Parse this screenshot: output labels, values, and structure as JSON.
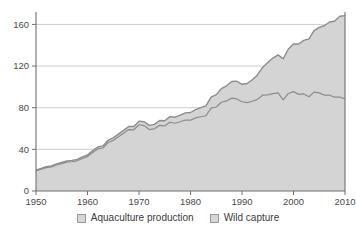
{
  "legend": {
    "position": "bottom-center",
    "items": [
      {
        "label": "Aquaculture production",
        "color": "#d6d6d6",
        "swatch": "square-swatch"
      },
      {
        "label": "Wild capture",
        "color": "#d6d6d6",
        "swatch": "square-swatch"
      }
    ]
  },
  "axes": {
    "y_ticks": [
      "0",
      "40",
      "80",
      "120",
      "160"
    ],
    "x_ticks": [
      "1950",
      "1960",
      "1970",
      "1980",
      "1990",
      "2000",
      "2010"
    ]
  },
  "colors": {
    "fill": "#d4d4d4",
    "line": "#8c8c8c",
    "grid": "#bfbfbf",
    "axis": "#6f6f6f",
    "text": "#3a3a3a",
    "background": "#ffffff"
  },
  "chart_data": {
    "type": "area",
    "stacked": true,
    "title": "",
    "subtitle": "",
    "xlabel": "",
    "ylabel": "",
    "xlim": [
      1950,
      2010
    ],
    "ylim": [
      0,
      170
    ],
    "grid": true,
    "legend_position": "bottom-center",
    "x": [
      1950,
      1951,
      1952,
      1953,
      1954,
      1955,
      1956,
      1957,
      1958,
      1959,
      1960,
      1961,
      1962,
      1963,
      1964,
      1965,
      1966,
      1967,
      1968,
      1969,
      1970,
      1971,
      1972,
      1973,
      1974,
      1975,
      1976,
      1977,
      1978,
      1979,
      1980,
      1981,
      1982,
      1983,
      1984,
      1985,
      1986,
      1987,
      1988,
      1989,
      1990,
      1991,
      1992,
      1993,
      1994,
      1995,
      1996,
      1997,
      1998,
      1999,
      2000,
      2001,
      2002,
      2003,
      2004,
      2005,
      2006,
      2007,
      2008,
      2009,
      2010
    ],
    "series": [
      {
        "name": "Wild capture",
        "values": [
          19.3,
          21.0,
          22.5,
          23.2,
          25.0,
          26.3,
          27.7,
          28.1,
          29.0,
          31.2,
          33.0,
          37.0,
          40.4,
          41.3,
          46.6,
          48.6,
          52.0,
          55.4,
          59.0,
          58.8,
          63.6,
          62.8,
          59.0,
          59.7,
          63.1,
          62.5,
          66.0,
          65.1,
          66.5,
          68.2,
          68.0,
          70.2,
          71.3,
          72.3,
          79.6,
          80.7,
          85.2,
          86.5,
          89.2,
          88.4,
          85.7,
          84.9,
          86.2,
          88.0,
          92.0,
          92.3,
          93.6,
          94.2,
          87.6,
          93.7,
          95.5,
          92.8,
          93.2,
          90.5,
          95.0,
          94.2,
          92.0,
          92.0,
          90.1,
          90.1,
          88.6
        ]
      },
      {
        "name": "Aquaculture production",
        "values": [
          0.6,
          0.7,
          0.8,
          0.9,
          1.0,
          1.1,
          1.2,
          1.3,
          1.4,
          1.5,
          1.6,
          1.8,
          1.9,
          2.0,
          2.2,
          2.4,
          2.6,
          2.8,
          3.0,
          3.2,
          3.5,
          3.7,
          4.0,
          4.3,
          4.6,
          5.0,
          5.4,
          5.8,
          6.3,
          6.8,
          7.4,
          8.0,
          8.7,
          9.5,
          10.6,
          11.8,
          13.1,
          14.5,
          16.0,
          17.0,
          16.8,
          18.3,
          20.6,
          23.5,
          26.7,
          31.2,
          34.1,
          36.5,
          39.4,
          42.7,
          45.7,
          48.4,
          51.4,
          55.6,
          59.0,
          63.0,
          66.7,
          70.3,
          73.2,
          77.7,
          79.8
        ]
      }
    ],
    "totals": [
      19.9,
      21.7,
      23.3,
      24.1,
      26.0,
      27.4,
      28.9,
      29.4,
      30.4,
      32.7,
      34.6,
      38.8,
      42.3,
      43.3,
      48.8,
      51.0,
      54.6,
      58.2,
      62.0,
      62.0,
      67.1,
      66.5,
      63.0,
      64.0,
      67.7,
      67.5,
      71.4,
      70.9,
      72.8,
      75.0,
      75.4,
      78.2,
      80.0,
      81.8,
      90.2,
      92.5,
      98.3,
      101.0,
      105.2,
      105.4,
      102.5,
      103.2,
      106.8,
      111.5,
      118.7,
      123.5,
      127.7,
      130.7,
      127.0,
      136.4,
      141.2,
      141.2,
      144.6,
      146.1,
      154.0,
      157.2,
      158.7,
      162.3,
      163.3,
      167.8,
      168.4
    ],
    "units": "million tonnes"
  }
}
